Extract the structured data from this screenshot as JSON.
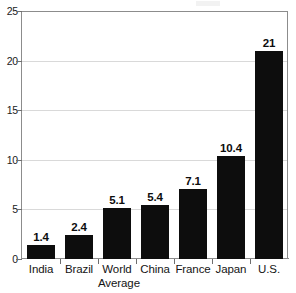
{
  "chart_data": {
    "type": "bar",
    "title": "",
    "subtitle": "",
    "xlabel": "",
    "ylabel": "",
    "categories": [
      "India",
      "Brazil",
      "World Average",
      "China",
      "France",
      "Japan",
      "U.S."
    ],
    "category_lines": [
      [
        "India"
      ],
      [
        "Brazil"
      ],
      [
        "World",
        "Average"
      ],
      [
        "China"
      ],
      [
        "France"
      ],
      [
        "Japan"
      ],
      [
        "U.S."
      ]
    ],
    "values": [
      1.4,
      2.4,
      5.1,
      5.4,
      7.1,
      10.4,
      21
    ],
    "value_labels": [
      "1.4",
      "2.4",
      "5.1",
      "5.4",
      "7.1",
      "10.4",
      "21"
    ],
    "ylim": [
      0,
      25
    ],
    "yticks": [
      0,
      5,
      10,
      15,
      20,
      25
    ],
    "ytick_labels": [
      "0",
      "5",
      "10",
      "15",
      "20",
      "25"
    ],
    "grid": true,
    "grid_axis": "y",
    "legend": false,
    "legend_position": "none",
    "bar_color": "#0d0d0d",
    "grid_color": "#d9d9d9",
    "axis_color": "#8c8c8c",
    "text_color": "#141414",
    "background": "#ffffff"
  }
}
